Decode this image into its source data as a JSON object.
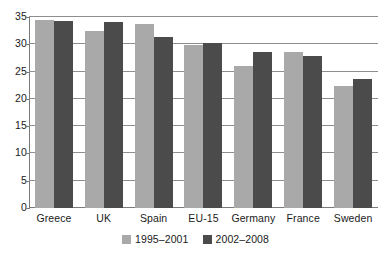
{
  "chart_data": {
    "type": "bar",
    "title": "",
    "subtitle": "",
    "xlabel": "",
    "ylabel": "",
    "categories": [
      "Greece",
      "UK",
      "Spain",
      "EU-15",
      "Germany",
      "France",
      "Sweden"
    ],
    "series": [
      {
        "name": "1995–2001",
        "color": "#a9a9a9",
        "values": [
          34.4,
          32.4,
          33.8,
          29.8,
          26.0,
          28.5,
          22.4
        ]
      },
      {
        "name": "2002–2008",
        "color": "#4b4b4b",
        "values": [
          34.2,
          34.0,
          31.4,
          30.3,
          28.6,
          27.8,
          23.6
        ]
      }
    ],
    "ylim": [
      0,
      35
    ],
    "ytick_values": [
      0,
      5,
      10,
      15,
      20,
      25,
      30,
      35
    ],
    "ytick_labels": [
      "0",
      "5",
      "10",
      "15",
      "20",
      "25",
      "30",
      "35"
    ],
    "grid": true,
    "grid_axis": "y",
    "legend_position": "bottom",
    "annotations": []
  },
  "legend": {
    "entries": [
      {
        "label": "1995–2001",
        "swatch": "legend-swatch-light"
      },
      {
        "label": "2002–2008",
        "swatch": "legend-swatch-dark"
      }
    ]
  },
  "colors": {
    "series_light": "#a9a9a9",
    "series_dark": "#4b4b4b",
    "gridline": "#8e8e8e",
    "axis": "#7a7a7a",
    "text": "#1a1a1a",
    "background": "#ffffff"
  }
}
